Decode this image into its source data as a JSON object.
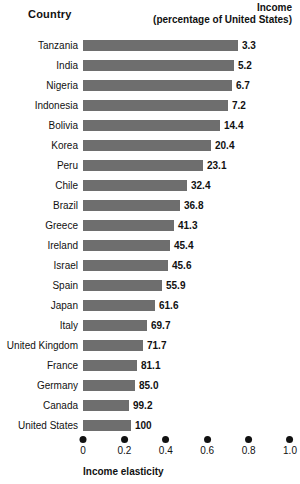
{
  "header": {
    "country_label": "Country",
    "income_label_line1": "Income",
    "income_label_line2": "(percentage of United States)"
  },
  "axis": {
    "title": "Income elasticity",
    "ticks": [
      "0",
      "0.2",
      "0.4",
      "0.6",
      "0.8",
      "1.0"
    ]
  },
  "colors": {
    "bar": "#6e6e6e",
    "text": "#111111",
    "background": "#ffffff"
  },
  "chart_data": {
    "type": "bar",
    "title": "",
    "subtitle": "",
    "orientation": "horizontal",
    "xlabel": "Income elasticity",
    "ylabel": "Country",
    "xlim": [
      0,
      1.0
    ],
    "xticks": [
      0,
      0.2,
      0.4,
      0.6,
      0.8,
      1.0
    ],
    "grid": false,
    "legend": null,
    "value_label_header": "Income (percentage of United States)",
    "categories": [
      "Tanzania",
      "India",
      "Nigeria",
      "Indonesia",
      "Bolivia",
      "Korea",
      "Peru",
      "Chile",
      "Brazil",
      "Greece",
      "Ireland",
      "Israel",
      "Spain",
      "Japan",
      "Italy",
      "United Kingdom",
      "France",
      "Germany",
      "Canada",
      "United States"
    ],
    "series": [
      {
        "name": "Income elasticity",
        "units": "elasticity",
        "values": [
          0.75,
          0.73,
          0.72,
          0.7,
          0.66,
          0.62,
          0.58,
          0.5,
          0.47,
          0.44,
          0.42,
          0.41,
          0.38,
          0.35,
          0.31,
          0.29,
          0.26,
          0.25,
          0.22,
          0.23
        ]
      },
      {
        "name": "Income (percentage of United States)",
        "units": "percent",
        "values": [
          3.3,
          5.2,
          6.7,
          7.2,
          14.4,
          20.4,
          23.1,
          32.4,
          36.8,
          41.3,
          45.4,
          45.6,
          55.9,
          61.6,
          69.7,
          71.7,
          81.1,
          85.0,
          99.2,
          100
        ]
      }
    ],
    "rows": [
      {
        "country": "Tanzania",
        "income_label": "3.3",
        "income": 3.3,
        "elasticity": 0.75
      },
      {
        "country": "India",
        "income_label": "5.2",
        "income": 5.2,
        "elasticity": 0.73
      },
      {
        "country": "Nigeria",
        "income_label": "6.7",
        "income": 6.7,
        "elasticity": 0.72
      },
      {
        "country": "Indonesia",
        "income_label": "7.2",
        "income": 7.2,
        "elasticity": 0.7
      },
      {
        "country": "Bolivia",
        "income_label": "14.4",
        "income": 14.4,
        "elasticity": 0.66
      },
      {
        "country": "Korea",
        "income_label": "20.4",
        "income": 20.4,
        "elasticity": 0.62
      },
      {
        "country": "Peru",
        "income_label": "23.1",
        "income": 23.1,
        "elasticity": 0.58
      },
      {
        "country": "Chile",
        "income_label": "32.4",
        "income": 32.4,
        "elasticity": 0.5
      },
      {
        "country": "Brazil",
        "income_label": "36.8",
        "income": 36.8,
        "elasticity": 0.47
      },
      {
        "country": "Greece",
        "income_label": "41.3",
        "income": 41.3,
        "elasticity": 0.44
      },
      {
        "country": "Ireland",
        "income_label": "45.4",
        "income": 45.4,
        "elasticity": 0.42
      },
      {
        "country": "Israel",
        "income_label": "45.6",
        "income": 45.6,
        "elasticity": 0.41
      },
      {
        "country": "Spain",
        "income_label": "55.9",
        "income": 55.9,
        "elasticity": 0.38
      },
      {
        "country": "Japan",
        "income_label": "61.6",
        "income": 61.6,
        "elasticity": 0.35
      },
      {
        "country": "Italy",
        "income_label": "69.7",
        "income": 69.7,
        "elasticity": 0.31
      },
      {
        "country": "United Kingdom",
        "income_label": "71.7",
        "income": 71.7,
        "elasticity": 0.29
      },
      {
        "country": "France",
        "income_label": "81.1",
        "income": 81.1,
        "elasticity": 0.26
      },
      {
        "country": "Germany",
        "income_label": "85.0",
        "income": 85.0,
        "elasticity": 0.25
      },
      {
        "country": "Canada",
        "income_label": "99.2",
        "income": 99.2,
        "elasticity": 0.22
      },
      {
        "country": "United States",
        "income_label": "100",
        "income": 100,
        "elasticity": 0.23
      }
    ]
  }
}
